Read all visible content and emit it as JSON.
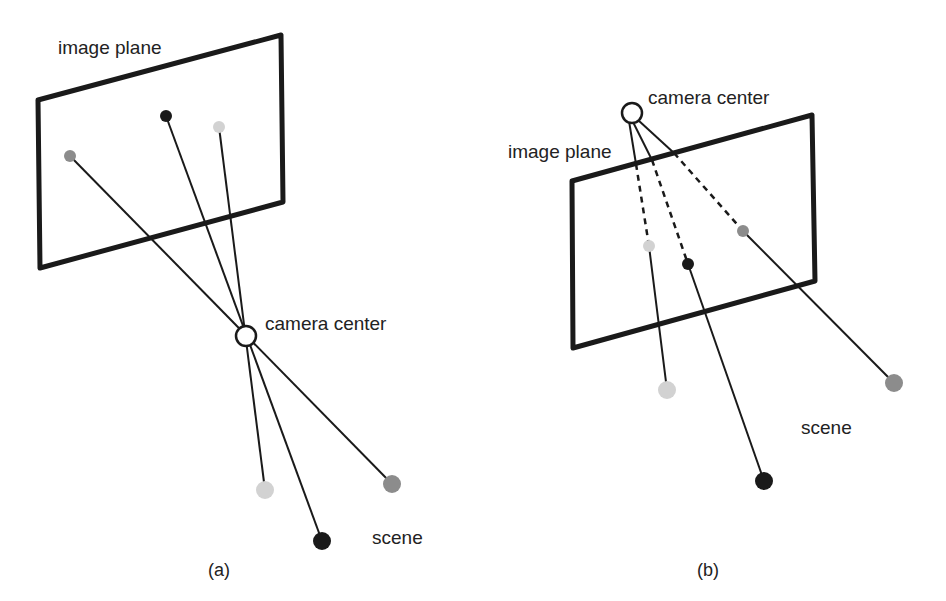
{
  "figure": {
    "panels": [
      {
        "id": "a",
        "caption": "(a)",
        "labels": {
          "image_plane": "image plane",
          "camera_center": "camera center",
          "scene": "scene"
        },
        "description": "Camera center lies between the image plane and the scene; rays pass through the center and the image is inverted."
      },
      {
        "id": "b",
        "caption": "(b)",
        "labels": {
          "image_plane": "image plane",
          "camera_center": "camera center",
          "scene": "scene"
        },
        "description": "Image plane placed in front of the camera center; rays from the center pass through the plane (dashed segments) to the scene."
      }
    ],
    "colors": {
      "stroke": "#1a1a1a",
      "point_black": "#1a1a1a",
      "point_gray": "#8c8c8c",
      "point_light": "#d2d2d2",
      "background": "#ffffff"
    }
  }
}
